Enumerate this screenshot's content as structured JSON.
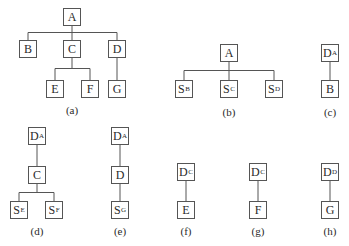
{
  "diagrams": [
    {
      "id": "a",
      "caption": "(a)",
      "caption_pos": [
        72,
        104
      ],
      "nodes": [
        {
          "id": "A",
          "main": "A",
          "sub": "",
          "x": 63,
          "y": 8
        },
        {
          "id": "B",
          "main": "B",
          "sub": "",
          "x": 19,
          "y": 40
        },
        {
          "id": "C",
          "main": "C",
          "sub": "",
          "x": 63,
          "y": 40
        },
        {
          "id": "D",
          "main": "D",
          "sub": "",
          "x": 108,
          "y": 40
        },
        {
          "id": "E",
          "main": "E",
          "sub": "",
          "x": 46,
          "y": 80
        },
        {
          "id": "F",
          "main": "F",
          "sub": "",
          "x": 81,
          "y": 80
        },
        {
          "id": "G",
          "main": "G",
          "sub": "",
          "x": 108,
          "y": 80
        }
      ],
      "edges": [
        [
          "A",
          "B"
        ],
        [
          "A",
          "C"
        ],
        [
          "A",
          "D"
        ],
        [
          "C",
          "E"
        ],
        [
          "C",
          "F"
        ],
        [
          "D",
          "G"
        ]
      ]
    },
    {
      "id": "b",
      "caption": "(b)",
      "caption_pos": [
        229,
        106
      ],
      "nodes": [
        {
          "id": "A",
          "main": "A",
          "sub": "",
          "x": 220,
          "y": 44
        },
        {
          "id": "SB",
          "main": "S",
          "sub": "B",
          "x": 175,
          "y": 80
        },
        {
          "id": "SC",
          "main": "S",
          "sub": "C",
          "x": 220,
          "y": 80
        },
        {
          "id": "SD",
          "main": "S",
          "sub": "D",
          "x": 265,
          "y": 80
        }
      ],
      "edges": [
        [
          "A",
          "SB"
        ],
        [
          "A",
          "SC"
        ],
        [
          "A",
          "SD"
        ]
      ]
    },
    {
      "id": "c",
      "caption": "(c)",
      "caption_pos": [
        330,
        106
      ],
      "nodes": [
        {
          "id": "DA",
          "main": "D",
          "sub": "A",
          "x": 321,
          "y": 44
        },
        {
          "id": "B",
          "main": "B",
          "sub": "",
          "x": 321,
          "y": 80
        }
      ],
      "edges": [
        [
          "DA",
          "B"
        ]
      ]
    },
    {
      "id": "d",
      "caption": "(d)",
      "caption_pos": [
        37,
        225
      ],
      "nodes": [
        {
          "id": "DA",
          "main": "D",
          "sub": "A",
          "x": 28,
          "y": 127
        },
        {
          "id": "C",
          "main": "C",
          "sub": "",
          "x": 28,
          "y": 166
        },
        {
          "id": "SE",
          "main": "S",
          "sub": "E",
          "x": 10,
          "y": 201
        },
        {
          "id": "SF",
          "main": "S",
          "sub": "F",
          "x": 45,
          "y": 201
        }
      ],
      "edges": [
        [
          "DA",
          "C"
        ],
        [
          "C",
          "SE"
        ],
        [
          "C",
          "SF"
        ]
      ]
    },
    {
      "id": "e",
      "caption": "(e)",
      "caption_pos": [
        120,
        225
      ],
      "nodes": [
        {
          "id": "DA",
          "main": "D",
          "sub": "A",
          "x": 111,
          "y": 127
        },
        {
          "id": "D",
          "main": "D",
          "sub": "",
          "x": 111,
          "y": 166
        },
        {
          "id": "SG",
          "main": "S",
          "sub": "G",
          "x": 111,
          "y": 201
        }
      ],
      "edges": [
        [
          "DA",
          "D"
        ],
        [
          "D",
          "SG"
        ]
      ]
    },
    {
      "id": "f",
      "caption": "(f)",
      "caption_pos": [
        186,
        225
      ],
      "nodes": [
        {
          "id": "DC",
          "main": "D",
          "sub": "C",
          "x": 177,
          "y": 163
        },
        {
          "id": "E",
          "main": "E",
          "sub": "",
          "x": 177,
          "y": 201
        }
      ],
      "edges": [
        [
          "DC",
          "E"
        ]
      ]
    },
    {
      "id": "g",
      "caption": "(g)",
      "caption_pos": [
        258,
        225
      ],
      "nodes": [
        {
          "id": "DC",
          "main": "D",
          "sub": "C",
          "x": 249,
          "y": 163
        },
        {
          "id": "F",
          "main": "F",
          "sub": "",
          "x": 249,
          "y": 201
        }
      ],
      "edges": [
        [
          "DC",
          "F"
        ]
      ]
    },
    {
      "id": "h",
      "caption": "(h)",
      "caption_pos": [
        330,
        225
      ],
      "nodes": [
        {
          "id": "DD",
          "main": "D",
          "sub": "D",
          "x": 321,
          "y": 163
        },
        {
          "id": "G",
          "main": "G",
          "sub": "",
          "x": 321,
          "y": 201
        }
      ],
      "edges": [
        [
          "DD",
          "G"
        ]
      ]
    }
  ],
  "style": {
    "line_color": "#555555",
    "box_size": 18
  }
}
